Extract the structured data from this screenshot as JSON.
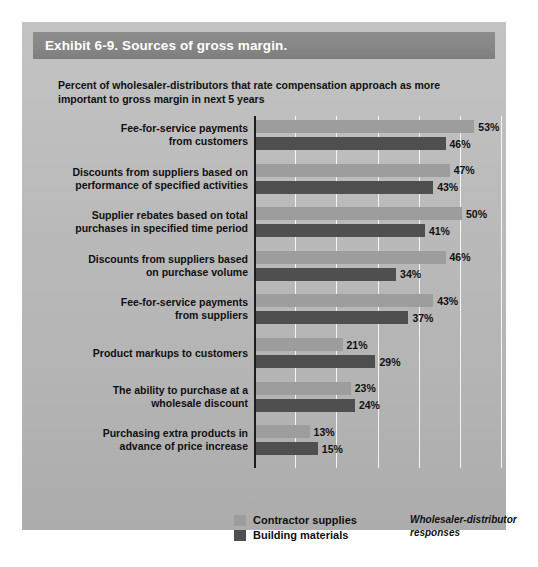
{
  "exhibit": {
    "title": "Exhibit 6-9. Sources of gross margin.",
    "subtitle": "Percent of wholesaler-distributors that rate compensation approach as more important to gross margin in next 5 years",
    "source_note": "Wholesaler-distributor responses"
  },
  "legend": {
    "items": [
      {
        "label": "Contractor supplies",
        "color": "#9d9d9d"
      },
      {
        "label": "Building materials",
        "color": "#4f4f4f"
      }
    ]
  },
  "chart_data": {
    "type": "bar",
    "orientation": "horizontal",
    "title": "Exhibit 6-9. Sources of gross margin.",
    "subtitle": "Percent of wholesaler-distributors that rate compensation approach as more important to gross margin in next 5 years",
    "xlabel": "",
    "ylabel": "",
    "xlim": [
      0,
      60
    ],
    "grid": true,
    "gridlines_every": 10,
    "legend_position": "bottom-center",
    "value_suffix": "%",
    "categories": [
      "Fee-for-service payments from customers",
      "Discounts from suppliers based on performance of specified activities",
      "Supplier rebates based on total purchases in specified time period",
      "Discounts from suppliers based on purchase volume",
      "Fee-for-service payments from suppliers",
      "Product markups to customers",
      "The ability to purchase at a wholesale discount",
      "Purchasing extra products in advance of price increase"
    ],
    "category_lines": [
      [
        "Fee-for-service payments",
        "from customers"
      ],
      [
        "Discounts from suppliers based on",
        "performance of specified activities"
      ],
      [
        "Supplier rebates based on total",
        "purchases in specified time period"
      ],
      [
        "Discounts from suppliers based",
        "on purchase volume"
      ],
      [
        "Fee-for-service payments",
        "from suppliers"
      ],
      [
        "Product markups to customers"
      ],
      [
        "The ability to purchase at a",
        "wholesale discount"
      ],
      [
        "Purchasing extra products in",
        "advance of price increase"
      ]
    ],
    "series": [
      {
        "name": "Contractor supplies",
        "color": "#9d9d9d",
        "values": [
          53,
          47,
          50,
          46,
          43,
          21,
          23,
          13
        ],
        "labels": [
          "53%",
          "47%",
          "50%",
          "46%",
          "43%",
          "21%",
          "23%",
          "13%"
        ]
      },
      {
        "name": "Building materials",
        "color": "#4f4f4f",
        "values": [
          46,
          43,
          41,
          34,
          37,
          29,
          24,
          15
        ],
        "labels": [
          "46%",
          "43%",
          "41%",
          "34%",
          "37%",
          "29%",
          "24%",
          "15%"
        ]
      }
    ]
  }
}
